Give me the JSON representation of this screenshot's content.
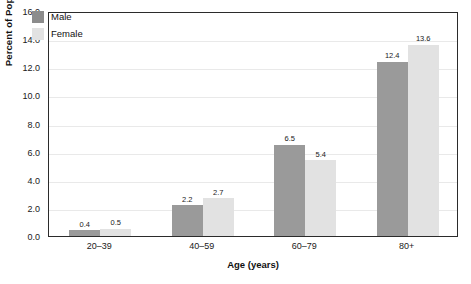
{
  "chart_data": {
    "type": "bar",
    "title": "",
    "xlabel": "Age (years)",
    "ylabel": "Percent of Population",
    "categories": [
      "20–39",
      "40–59",
      "60–79",
      "80+"
    ],
    "series": [
      {
        "name": "Male",
        "color": "#9a9a9a",
        "values": [
          0.4,
          2.2,
          6.5,
          12.4
        ]
      },
      {
        "name": "Female",
        "color": "#e2e2e2",
        "values": [
          0.5,
          2.7,
          5.4,
          13.6
        ]
      }
    ],
    "value_labels": [
      [
        "0.4",
        "0.5"
      ],
      [
        "2.2",
        "2.7"
      ],
      [
        "6.5",
        "5.4"
      ],
      [
        "12.4",
        "13.6"
      ]
    ],
    "ylim": [
      0,
      16
    ],
    "ytick_values": [
      0,
      2,
      4,
      6,
      8,
      10,
      12,
      14,
      16
    ],
    "ytick_labels": [
      "0.0",
      "2.0",
      "4.0",
      "6.0",
      "8.0",
      "10.0",
      "12.0",
      "14.0",
      "16.0"
    ],
    "grid": true,
    "legend_position": "top-left",
    "legend_entries": [
      "Male",
      "Female"
    ]
  }
}
